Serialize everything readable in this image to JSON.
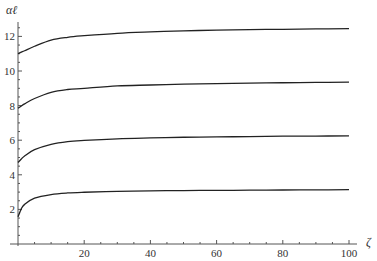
{
  "chart_data": {
    "type": "line",
    "title": "",
    "xlabel": "ζ",
    "ylabel": "αℓ",
    "xlim": [
      0,
      100
    ],
    "ylim": [
      0,
      13
    ],
    "grid": false,
    "legend": null,
    "x_ticks": [
      20,
      40,
      60,
      80,
      100
    ],
    "x_tick_labels": [
      "20",
      "40",
      "60",
      "80",
      "100"
    ],
    "y_ticks": [
      2,
      4,
      6,
      8,
      10,
      12
    ],
    "y_tick_labels": [
      "2",
      "4",
      "6",
      "8",
      "10",
      "12"
    ],
    "x": [
      0,
      1,
      2,
      5,
      10,
      15,
      20,
      30,
      40,
      50,
      60,
      70,
      80,
      90,
      100
    ],
    "series": [
      {
        "name": "branch 1",
        "values": [
          1.57,
          2.03,
          2.29,
          2.65,
          2.86,
          2.95,
          2.99,
          3.04,
          3.07,
          3.09,
          3.1,
          3.11,
          3.12,
          3.13,
          3.14
        ]
      },
      {
        "name": "branch 2",
        "values": [
          4.71,
          4.91,
          5.09,
          5.45,
          5.76,
          5.92,
          5.99,
          6.08,
          6.13,
          6.17,
          6.19,
          6.21,
          6.23,
          6.24,
          6.25
        ]
      },
      {
        "name": "branch 3",
        "values": [
          7.85,
          7.98,
          8.1,
          8.41,
          8.77,
          8.93,
          9.0,
          9.14,
          9.19,
          9.24,
          9.27,
          9.3,
          9.32,
          9.34,
          9.36
        ]
      },
      {
        "name": "branch 4",
        "values": [
          11.0,
          11.09,
          11.17,
          11.43,
          11.79,
          11.95,
          12.04,
          12.18,
          12.26,
          12.32,
          12.36,
          12.39,
          12.41,
          12.43,
          12.45
        ]
      }
    ]
  }
}
